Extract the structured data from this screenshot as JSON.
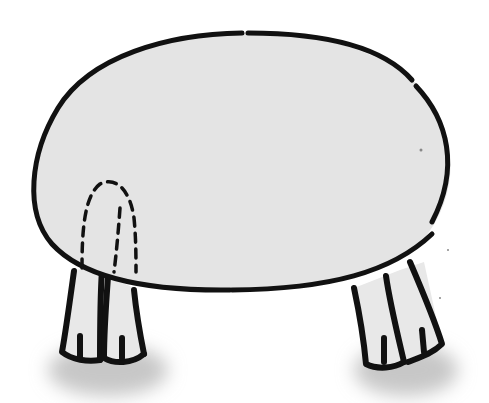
{
  "illustration": {
    "description": "Cartoon oval-bodied animal on four legs; one leg hidden behind the body drawn with dashed lines",
    "canvas": {
      "width": 489,
      "height": 403,
      "background": "#ffffff"
    },
    "colors": {
      "body_fill": "#e4e4e4",
      "leg_fill": "#e8e8e8",
      "outline": "#111111",
      "shadow": "#bdbdbd"
    },
    "body": {
      "path": "M244 33 C330 32 412 58 438 112 C462 162 448 208 426 236 C402 268 340 288 228 290 C150 291 80 278 50 242 C24 212 30 154 56 110 C86 58 160 34 244 33 Z",
      "outline_segments": [
        "M242 33 C168 34 90 56 58 108 C30 154 24 212 52 244 C84 279 150 291 230 290",
        "M248 33 C326 33 384 48 412 80",
        "M416 86 C448 120 460 168 432 222",
        "M232 290 C330 289 392 272 432 234"
      ]
    },
    "hidden_leg": {
      "dashed": true,
      "outer": "M82 268 C82 232 84 196 100 184 C116 176 130 190 134 218 C136 238 136 258 136 272",
      "inner": "M120 208 C118 236 116 256 114 272"
    },
    "front_left_legs": {
      "fill_path": "M74 270 L62 352 C72 360 90 362 100 360 L102 268 Z M108 276 L104 360 C114 364 134 364 144 354 L134 288 Z",
      "strokes": [
        "M74 271 C70 300 66 330 62 352 C72 360 88 362 100 360",
        "M102 270 C100 300 100 332 100 360",
        "M80 336 L80 358",
        "M108 277 C106 304 104 334 104 358 C114 364 132 364 144 354",
        "M134 290 C136 310 140 334 144 354",
        "M122 338 L122 358"
      ]
    },
    "back_right_legs": {
      "fill_path": "M354 288 L366 364 C378 370 396 368 408 362 C422 360 436 352 442 344 L424 262 L400 270 Z",
      "strokes": [
        "M354 288 C360 316 364 342 366 364 C378 370 394 368 404 362",
        "M386 276 C390 304 398 336 404 362",
        "M384 338 L384 362",
        "M410 262 C422 290 434 318 442 344 C432 354 418 358 408 362",
        "M422 330 L424 352"
      ]
    },
    "shadows": [
      {
        "cx": 108,
        "cy": 370,
        "rx": 60,
        "ry": 26
      },
      {
        "cx": 406,
        "cy": 370,
        "rx": 52,
        "ry": 26
      }
    ],
    "specks": [
      {
        "x": 421,
        "y": 150,
        "r": 1.5
      },
      {
        "x": 448,
        "y": 250,
        "r": 1
      },
      {
        "x": 440,
        "y": 298,
        "r": 1
      }
    ]
  }
}
